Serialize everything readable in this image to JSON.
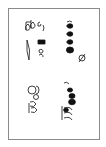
{
  "figure": {
    "border_color": "#8a8a8a",
    "ink_color": "#111111",
    "groups": [
      {
        "name": "upper-left-cluster",
        "glyphs": [
          "beamed-notes",
          "rest",
          "slur"
        ]
      },
      {
        "name": "upper-right-run",
        "glyphs": [
          "note",
          "note",
          "note",
          "note",
          "note",
          "accidental"
        ]
      },
      {
        "name": "lower-left-cluster",
        "glyphs": [
          "clef-like",
          "note",
          "note"
        ]
      },
      {
        "name": "lower-right-run",
        "glyphs": [
          "note",
          "note",
          "note",
          "note",
          "note",
          "note"
        ]
      }
    ]
  }
}
